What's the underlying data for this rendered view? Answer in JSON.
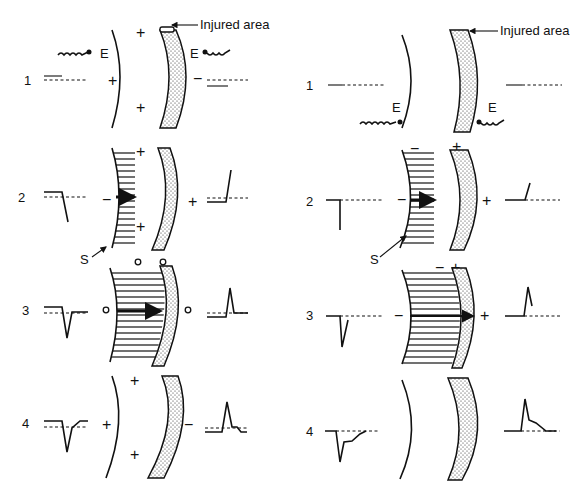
{
  "figure": {
    "panels": [
      {
        "side": "left",
        "callout": "Injured area",
        "electrode_label": "E",
        "stimulus_label": "S",
        "rows": [
          {
            "number": "1",
            "signs_left": [
              "+",
              "+"
            ],
            "signs_center": [
              "+"
            ],
            "sign_right": "−"
          },
          {
            "number": "2",
            "sign_front": "−",
            "sign_top": "−",
            "signs_center": [
              "+",
              "+"
            ],
            "sign_right": "+"
          },
          {
            "number": "3",
            "zero_marks": [
              "o",
              "o",
              "o",
              "o"
            ]
          },
          {
            "number": "4",
            "sign_left": "+",
            "signs_center": [
              "+",
              "+"
            ],
            "sign_right": "−"
          }
        ]
      },
      {
        "side": "right",
        "callout": "Injured area",
        "electrode_label": "E",
        "stimulus_label": "S",
        "rows": [
          {
            "number": "1"
          },
          {
            "number": "2",
            "sign_front": "−",
            "sign_top": "−",
            "sign_tissue": "+",
            "sign_right": "+"
          },
          {
            "number": "3",
            "sign_front": "−",
            "sign_top_minus": "−",
            "sign_top_plus": "+",
            "sign_right": "+"
          },
          {
            "number": "4"
          }
        ]
      }
    ]
  }
}
